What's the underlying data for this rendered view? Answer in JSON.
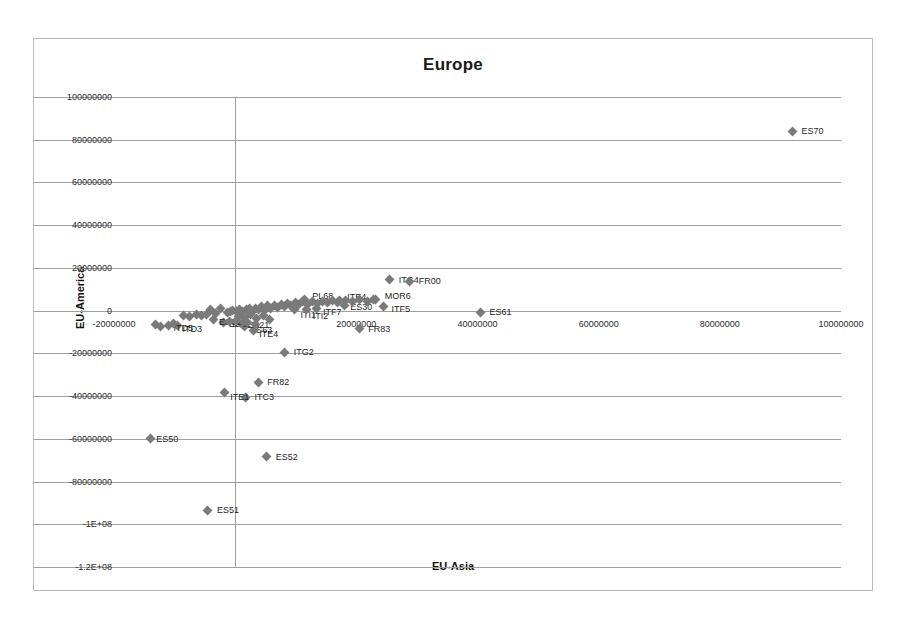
{
  "chart_data": {
    "type": "scatter",
    "title": "Europe",
    "xlabel": "EU-Asia",
    "ylabel": "EU-America",
    "xlim": [
      -20000000,
      100000000
    ],
    "ylim": [
      -120000000,
      100000000
    ],
    "grid": true,
    "legend": "none",
    "marker": "diamond",
    "marker_color": "#7a7a7a",
    "xticks": [
      "-20000000",
      "0",
      "20000000",
      "40000000",
      "60000000",
      "80000000",
      "100000000"
    ],
    "xtick_values": [
      -20000000,
      0,
      20000000,
      40000000,
      60000000,
      80000000,
      100000000
    ],
    "yticks": [
      "100000000",
      "80000000",
      "60000000",
      "40000000",
      "20000000",
      "0",
      "-20000000",
      "-40000000",
      "-60000000",
      "-80000000",
      "-1E+08",
      "-1.2E+08"
    ],
    "ytick_values": [
      100000000,
      80000000,
      60000000,
      40000000,
      20000000,
      0,
      -20000000,
      -40000000,
      -60000000,
      -80000000,
      -100000000,
      -120000000
    ],
    "points": [
      {
        "label": "ES70",
        "x": 92000000,
        "y": 84000000,
        "label_dx": 9,
        "label_dy": 0
      },
      {
        "label": "ITG4",
        "x": 25500000,
        "y": 14500000,
        "label_dx": 9,
        "label_dy": 0
      },
      {
        "label": "FR00",
        "x": 28800000,
        "y": 13800000,
        "label_dx": 9,
        "label_dy": 0
      },
      {
        "label": "MOR6",
        "x": 23200000,
        "y": 5200000,
        "label_dx": 9,
        "label_dy": -4
      },
      {
        "label": "PL68",
        "x": 11400000,
        "y": 5000000,
        "label_dx": 8,
        "label_dy": -4
      },
      {
        "label": "ITE4",
        "x": 17200000,
        "y": 4600000,
        "label_dx": 8,
        "label_dy": -4
      },
      {
        "label": "ITF5",
        "x": 24500000,
        "y": 2100000,
        "label_dx": 8,
        "label_dy": 3
      },
      {
        "label": "ES30",
        "x": 18000000,
        "y": 2600000,
        "label_dx": 6,
        "label_dy": 2
      },
      {
        "label": "ITF7",
        "x": 13500000,
        "y": 1200000,
        "label_dx": 6,
        "label_dy": 4
      },
      {
        "label": "ITI1",
        "x": 9800000,
        "y": 600000,
        "label_dx": 6,
        "label_dy": 6
      },
      {
        "label": "ITI2",
        "x": 11800000,
        "y": 400000,
        "label_dx": 6,
        "label_dy": 6
      },
      {
        "label": "ES61",
        "x": 40500000,
        "y": -800000,
        "label_dx": 9,
        "label_dy": 0
      },
      {
        "label": "FR83",
        "x": 20500000,
        "y": -8500000,
        "label_dx": 9,
        "label_dy": 0
      },
      {
        "label": "ITG2",
        "x": 8200000,
        "y": -19500000,
        "label_dx": 9,
        "label_dy": 0
      },
      {
        "label": "FR82",
        "x": 3800000,
        "y": -33500000,
        "label_dx": 9,
        "label_dy": 0
      },
      {
        "label": "ITC3",
        "x": 1700000,
        "y": -40500000,
        "label_dx": 9,
        "label_dy": 0
      },
      {
        "label": "ITE1",
        "x": -1800000,
        "y": -38500000,
        "label_dx": 6,
        "label_dy": 4
      },
      {
        "label": "ES52",
        "x": 5200000,
        "y": -68500000,
        "label_dx": 9,
        "label_dy": 0
      },
      {
        "label": "ES51",
        "x": -4500000,
        "y": -93500000,
        "label_dx": 9,
        "label_dy": 0
      },
      {
        "label": "ES50",
        "x": -14000000,
        "y": -60000000,
        "label_dx": 6,
        "label_dy": 0
      },
      {
        "label": "ES63",
        "x": 1500000,
        "y": -7200000,
        "label_dx": 6,
        "label_dy": 4
      },
      {
        "label": "ITE4",
        "x": 3000000,
        "y": -9200000,
        "label_dx": 6,
        "label_dy": 4
      },
      {
        "label": "ES62",
        "x": -2000000,
        "y": -5500000,
        "label_dx": 6,
        "label_dy": 2
      },
      {
        "label": "ES21",
        "x": 1000000,
        "y": -6000000,
        "label_dx": 6,
        "label_dy": 2
      },
      {
        "label": "ES61",
        "x": -3500000,
        "y": -4200000,
        "label_dx": 5,
        "label_dy": 2
      },
      {
        "label": "ITD3",
        "x": -9500000,
        "y": -7000000,
        "label_dx": 5,
        "label_dy": 3
      },
      {
        "label": "ITD5",
        "x": -11000000,
        "y": -6800000,
        "label_dx": 5,
        "label_dy": 3
      },
      {
        "label": "",
        "x": -1200000,
        "y": -800000
      },
      {
        "label": "",
        "x": -800000,
        "y": -400000
      },
      {
        "label": "",
        "x": -400000,
        "y": 200000
      },
      {
        "label": "",
        "x": 300000,
        "y": -200000
      },
      {
        "label": "",
        "x": 700000,
        "y": 400000
      },
      {
        "label": "",
        "x": 1200000,
        "y": -600000
      },
      {
        "label": "",
        "x": 1800000,
        "y": 300000
      },
      {
        "label": "",
        "x": 2300000,
        "y": 900000
      },
      {
        "label": "",
        "x": 2800000,
        "y": -300000
      },
      {
        "label": "",
        "x": 3300000,
        "y": 1200000
      },
      {
        "label": "",
        "x": 3900000,
        "y": 500000
      },
      {
        "label": "",
        "x": 4400000,
        "y": 1800000
      },
      {
        "label": "",
        "x": 4900000,
        "y": 100000
      },
      {
        "label": "",
        "x": 5400000,
        "y": 2200000
      },
      {
        "label": "",
        "x": 5900000,
        "y": 1000000
      },
      {
        "label": "",
        "x": 6500000,
        "y": 2600000
      },
      {
        "label": "",
        "x": 7000000,
        "y": 1500000
      },
      {
        "label": "",
        "x": 7600000,
        "y": 3000000
      },
      {
        "label": "",
        "x": 8100000,
        "y": 1900000
      },
      {
        "label": "",
        "x": 8700000,
        "y": 3400000
      },
      {
        "label": "",
        "x": 9200000,
        "y": 2300000
      },
      {
        "label": "",
        "x": 9900000,
        "y": 3800000
      },
      {
        "label": "",
        "x": 10500000,
        "y": 2700000
      },
      {
        "label": "",
        "x": 11100000,
        "y": 4100000
      },
      {
        "label": "",
        "x": 12000000,
        "y": 3100000
      },
      {
        "label": "",
        "x": 12800000,
        "y": 4300000
      },
      {
        "label": "",
        "x": 13600000,
        "y": 3500000
      },
      {
        "label": "",
        "x": 14400000,
        "y": 4500000
      },
      {
        "label": "",
        "x": 15200000,
        "y": 3700000
      },
      {
        "label": "",
        "x": 16000000,
        "y": 4700000
      },
      {
        "label": "",
        "x": 16900000,
        "y": 3900000
      },
      {
        "label": "",
        "x": 18200000,
        "y": 4800000
      },
      {
        "label": "",
        "x": 19400000,
        "y": 4200000
      },
      {
        "label": "",
        "x": 20600000,
        "y": 5000000
      },
      {
        "label": "",
        "x": 21800000,
        "y": 4400000
      },
      {
        "label": "",
        "x": 22900000,
        "y": 5100000
      },
      {
        "label": "",
        "x": -2500000,
        "y": 800000
      },
      {
        "label": "",
        "x": -3200000,
        "y": -1200000
      },
      {
        "label": "",
        "x": -4000000,
        "y": 400000
      },
      {
        "label": "",
        "x": -4800000,
        "y": -1800000
      },
      {
        "label": "",
        "x": -5600000,
        "y": -2400000
      },
      {
        "label": "",
        "x": -6400000,
        "y": -1600000
      },
      {
        "label": "",
        "x": -7500000,
        "y": -2800000
      },
      {
        "label": "",
        "x": -8600000,
        "y": -2200000
      },
      {
        "label": "",
        "x": -10200000,
        "y": -6200000
      },
      {
        "label": "",
        "x": -12400000,
        "y": -7400000
      },
      {
        "label": "",
        "x": -13200000,
        "y": -6600000
      },
      {
        "label": "",
        "x": 600000,
        "y": -2600000
      },
      {
        "label": "",
        "x": 1600000,
        "y": -3200000
      },
      {
        "label": "",
        "x": 2600000,
        "y": -2000000
      },
      {
        "label": "",
        "x": 3600000,
        "y": -3600000
      },
      {
        "label": "",
        "x": 4600000,
        "y": -2400000
      },
      {
        "label": "",
        "x": 5600000,
        "y": -4000000
      },
      {
        "label": "",
        "x": -1000000,
        "y": -5000000
      },
      {
        "label": "",
        "x": 200000,
        "y": -4400000
      },
      {
        "label": "",
        "x": 2000000,
        "y": -5600000
      },
      {
        "label": "",
        "x": 3400000,
        "y": -6400000
      }
    ]
  }
}
